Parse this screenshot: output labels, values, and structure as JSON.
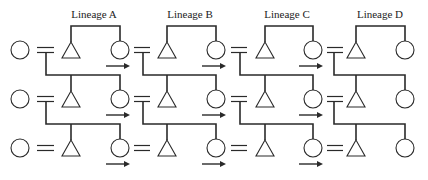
{
  "diagram": {
    "lineages": [
      {
        "label": "Lineage A",
        "label_x": 94,
        "triangle_x": 71,
        "circle_x": 120,
        "double_x1": 37,
        "double_x2": 54,
        "drop_x": 46,
        "arrow": true
      },
      {
        "label": "Lineage B",
        "label_x": 190,
        "triangle_x": 167,
        "circle_x": 216,
        "double_x1": 134,
        "double_x2": 150,
        "drop_x": 143,
        "arrow": true
      },
      {
        "label": "Lineage C",
        "label_x": 287,
        "triangle_x": 265,
        "circle_x": 313,
        "double_x1": 231,
        "double_x2": 247,
        "drop_x": 240,
        "arrow": true
      },
      {
        "label": "Lineage D",
        "label_x": 380,
        "triangle_x": 356,
        "circle_x": 405,
        "double_x1": 327,
        "double_x2": 343,
        "drop_x": 334,
        "arrow": false
      }
    ],
    "generation_rows_y": [
      50,
      99,
      148
    ],
    "first_circle_x": 20,
    "symbols": {
      "circle": "female",
      "triangle": "male",
      "double-line": "marriage",
      "arrow": "direction of marriage exchange"
    },
    "stroke_color": "#2a2a2a"
  }
}
